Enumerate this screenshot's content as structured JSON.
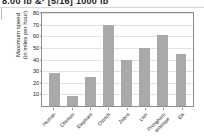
{
  "header": {
    "clipped_text": "8.00 lb        &·  [5/16]  1000 lb"
  },
  "chart_data": {
    "type": "bar",
    "title": "",
    "xlabel": "",
    "ylabel": "Maximum speed (in miles per hour)",
    "ylabel_line1": "Maximum speed",
    "ylabel_line2": "(in miles per hour)",
    "categories": [
      "Human",
      "Chicken",
      "Elephant",
      "Ostrich",
      "Zebra",
      "Lion",
      "Pronghorn antelope",
      "Elk"
    ],
    "values": [
      28,
      9,
      25,
      70,
      40,
      50,
      61,
      45
    ],
    "ylim": [
      0,
      80
    ],
    "yticks": [
      10,
      20,
      30,
      40,
      50,
      60,
      70,
      80
    ],
    "ytick_labels": [
      "10",
      "20",
      "30",
      "40",
      "50",
      "60",
      "70",
      "80"
    ],
    "grid": true,
    "legend": "none",
    "bar_color": "#a9a9a9",
    "axis_color": "#8c8c8c",
    "grid_color": "#e2e2e2"
  }
}
